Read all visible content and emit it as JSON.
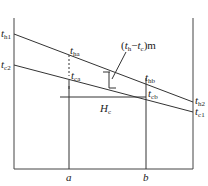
{
  "diagram": {
    "type": "temperature-profile",
    "labels": {
      "t_h1": {
        "base": "t",
        "sub": "h1"
      },
      "t_c2": {
        "base": "t",
        "sub": "c2"
      },
      "t_ha": {
        "base": "t",
        "sub": "ha"
      },
      "t_ca": {
        "base": "t",
        "sub": "ca"
      },
      "t_hb": {
        "base": "t",
        "sub": "hb"
      },
      "t_cb": {
        "base": "t",
        "sub": "cb"
      },
      "t_h2": {
        "base": "t",
        "sub": "h2"
      },
      "t_c1": {
        "base": "t",
        "sub": "c1"
      },
      "mean_diff": {
        "open": "(",
        "t1": "t",
        "s1": "h",
        "dash": "−",
        "t2": "t",
        "s2": "c",
        "close": ")m"
      },
      "H_c": {
        "base": "H",
        "sub": "c"
      },
      "a": "a",
      "b": "b"
    },
    "colors": {
      "line": "#333333"
    }
  }
}
